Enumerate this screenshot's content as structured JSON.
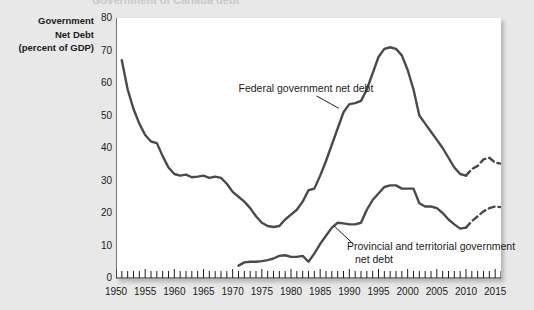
{
  "figure": {
    "background_color": "#e8e8e8",
    "plot_background_color": "#ffffff",
    "line_color": "#4a4a4a",
    "text_color": "#1b1b1b",
    "cropped_title_remnant": "Government of Canada debt"
  },
  "axis_title": {
    "line1": "Government",
    "line2": "Net Debt",
    "line3": "(percent of GDP)"
  },
  "annotations": {
    "federal": "Federal government net debt",
    "provincial_line1": "Provincial and territorial government",
    "provincial_line2": "net debt"
  },
  "chart_data": {
    "type": "line",
    "title": "",
    "xlabel": "",
    "ylabel": "Government Net Debt (percent of GDP)",
    "xlim": [
      1950,
      2016
    ],
    "ylim": [
      0,
      80
    ],
    "grid": false,
    "legend": "annotations-inline",
    "ytick_labels": [
      "0",
      "10",
      "20",
      "30",
      "40",
      "50",
      "60",
      "70",
      "80"
    ],
    "ytick_values": [
      0,
      10,
      20,
      30,
      40,
      50,
      60,
      70,
      80
    ],
    "xtick_labels": [
      "1950",
      "1955",
      "1960",
      "1965",
      "1970",
      "1975",
      "1980",
      "1985",
      "1990",
      "1995",
      "2000",
      "2005",
      "2010",
      "2015"
    ],
    "xtick_values": [
      1950,
      1955,
      1960,
      1965,
      1970,
      1975,
      1980,
      1985,
      1990,
      1995,
      2000,
      2005,
      2010,
      2015
    ],
    "minor_tick_interval": 1,
    "series": [
      {
        "name": "Federal government net debt",
        "style": "solid",
        "x": [
          1951,
          1952,
          1953,
          1954,
          1955,
          1956,
          1957,
          1958,
          1959,
          1960,
          1961,
          1962,
          1963,
          1964,
          1965,
          1966,
          1967,
          1968,
          1969,
          1970,
          1971,
          1972,
          1973,
          1974,
          1975,
          1976,
          1977,
          1978,
          1979,
          1980,
          1981,
          1982,
          1983,
          1984,
          1985,
          1986,
          1987,
          1988,
          1989,
          1990,
          1991,
          1992,
          1993,
          1994,
          1995,
          1996,
          1997,
          1998,
          1999,
          2000,
          2001,
          2002,
          2003,
          2004,
          2005,
          2006,
          2007,
          2008,
          2009,
          2010
        ],
        "values": [
          67.0,
          58.0,
          52.0,
          47.5,
          44.0,
          42.0,
          41.5,
          37.5,
          34.0,
          32.0,
          31.5,
          31.8,
          31.0,
          31.2,
          31.5,
          30.8,
          31.2,
          30.8,
          29.0,
          26.5,
          25.0,
          23.5,
          21.5,
          19.0,
          17.0,
          16.0,
          15.7,
          16.0,
          18.0,
          19.5,
          21.0,
          23.5,
          27.0,
          27.5,
          31.5,
          36.0,
          41.0,
          46.0,
          51.0,
          53.5,
          53.8,
          54.5,
          58.0,
          63.0,
          68.0,
          70.5,
          71.0,
          70.5,
          68.5,
          64.0,
          58.0,
          50.0,
          47.5,
          45.0,
          42.5,
          40.0,
          37.0,
          34.0,
          32.0,
          31.5
        ]
      },
      {
        "name": "Federal government net debt (projected)",
        "style": "dashed",
        "x": [
          2010,
          2011,
          2012,
          2013,
          2014,
          2015,
          2016
        ],
        "values": [
          31.5,
          33.5,
          34.5,
          36.5,
          37.0,
          35.5,
          35.2
        ]
      },
      {
        "name": "Provincial and territorial government net debt",
        "style": "solid",
        "x": [
          1971,
          1972,
          1973,
          1974,
          1975,
          1976,
          1977,
          1978,
          1979,
          1980,
          1981,
          1982,
          1983,
          1984,
          1985,
          1986,
          1987,
          1988,
          1989,
          1990,
          1991,
          1992,
          1993,
          1994,
          1995,
          1996,
          1997,
          1998,
          1999,
          2000,
          2001,
          2002,
          2003,
          2004,
          2005,
          2006,
          2007,
          2008,
          2009,
          2010
        ],
        "values": [
          3.8,
          4.8,
          5.0,
          5.0,
          5.2,
          5.5,
          6.0,
          6.8,
          7.0,
          6.5,
          6.5,
          6.8,
          5.0,
          7.5,
          10.5,
          13.0,
          15.5,
          17.0,
          16.8,
          16.5,
          16.5,
          17.0,
          21.0,
          24.0,
          26.0,
          28.0,
          28.5,
          28.5,
          27.5,
          27.5,
          27.5,
          23.0,
          22.0,
          22.0,
          21.5,
          20.0,
          18.0,
          16.5,
          15.2,
          15.5
        ]
      },
      {
        "name": "Provincial and territorial government net debt (projected)",
        "style": "dashed",
        "x": [
          2010,
          2011,
          2012,
          2013,
          2014,
          2015,
          2016
        ],
        "values": [
          15.5,
          17.5,
          19.0,
          20.5,
          21.5,
          22.0,
          21.8
        ]
      }
    ]
  }
}
